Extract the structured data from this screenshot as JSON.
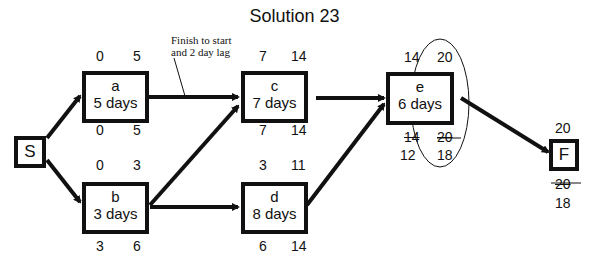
{
  "title": "Solution 23",
  "annotation": {
    "line1": "Finish to start",
    "line2": "and 2 day lag"
  },
  "nodes": {
    "S": {
      "label": "S"
    },
    "F": {
      "label": "F",
      "top": "20",
      "bottom_old": "20",
      "bottom": "18"
    },
    "a": {
      "name": "a",
      "duration": "5 days",
      "es": "0",
      "ef": "5",
      "ls": "0",
      "lf": "5"
    },
    "b": {
      "name": "b",
      "duration": "3 days",
      "es": "0",
      "ef": "3",
      "ls": "3",
      "lf": "6"
    },
    "c": {
      "name": "c",
      "duration": "7 days",
      "es": "7",
      "ef": "14",
      "ls": "7",
      "lf": "14"
    },
    "d": {
      "name": "d",
      "duration": "8 days",
      "es": "3",
      "ef": "11",
      "ls": "6",
      "lf": "14"
    },
    "e": {
      "name": "e",
      "duration": "6 days",
      "es": "14",
      "ef": "20",
      "ls_old": "14",
      "lf_old": "20",
      "ls": "12",
      "lf": "18"
    }
  },
  "edges": [
    [
      "S",
      "a"
    ],
    [
      "S",
      "b"
    ],
    [
      "a",
      "c"
    ],
    [
      "b",
      "c"
    ],
    [
      "b",
      "d"
    ],
    [
      "c",
      "e"
    ],
    [
      "d",
      "e"
    ],
    [
      "e",
      "F"
    ]
  ]
}
